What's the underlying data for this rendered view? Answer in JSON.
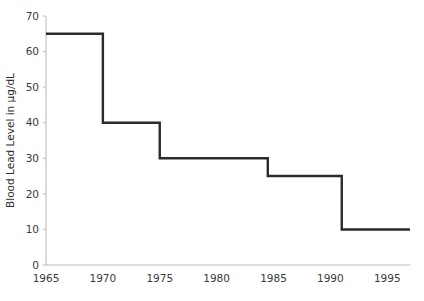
{
  "chart_data": {
    "type": "line",
    "subtype": "step-post",
    "title": "",
    "xlabel": "",
    "ylabel": "Blood Lead Level in µg/dL",
    "xlim": [
      1965,
      1997
    ],
    "ylim": [
      0,
      70
    ],
    "grid": false,
    "legend": null,
    "x_ticks": [
      1965,
      1970,
      1975,
      1980,
      1985,
      1990,
      1995
    ],
    "x_tick_labels": [
      "1965",
      "1970",
      "1975",
      "1980",
      "1985",
      "1990",
      "1995"
    ],
    "y_ticks": [
      0,
      10,
      20,
      30,
      40,
      50,
      60,
      70
    ],
    "y_tick_labels": [
      "0",
      "10",
      "20",
      "30",
      "40",
      "50",
      "60",
      "70"
    ],
    "line_color": "#2b2b2b",
    "axis_color": "#b9b9b9",
    "series": [
      {
        "name": "Blood Lead Level",
        "steps": [
          {
            "x_start": 1965,
            "x_end": 1970,
            "value": 65
          },
          {
            "x_start": 1970,
            "x_end": 1975,
            "value": 40
          },
          {
            "x_start": 1975,
            "x_end": 1984.5,
            "value": 30
          },
          {
            "x_start": 1984.5,
            "x_end": 1991,
            "value": 25
          },
          {
            "x_start": 1991,
            "x_end": 1997,
            "value": 10
          }
        ],
        "x": [
          1965,
          1970,
          1970,
          1975,
          1975,
          1984.5,
          1984.5,
          1991,
          1991,
          1997
        ],
        "values": [
          65,
          65,
          40,
          40,
          30,
          30,
          25,
          25,
          10,
          10
        ]
      }
    ]
  },
  "plot_geometry": {
    "left": 46,
    "right": 410,
    "top": 16,
    "bottom": 265
  }
}
